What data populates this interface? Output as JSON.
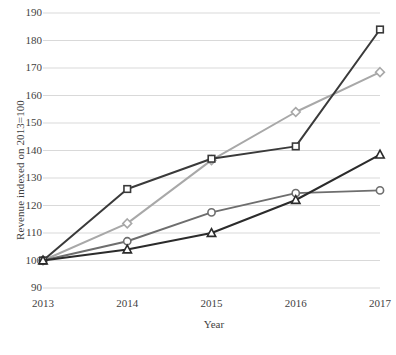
{
  "chart_data": {
    "type": "line",
    "title": "",
    "xlabel": "Year",
    "ylabel": "Revenue indexed on 2013=100",
    "categories": [
      "2013",
      "2014",
      "2015",
      "2016",
      "2017"
    ],
    "x_tick_labels": [
      "2013",
      "2014",
      "2015",
      "2016",
      "2017"
    ],
    "y_tick_labels": [
      "90",
      "100",
      "110",
      "120",
      "130",
      "140",
      "150",
      "160",
      "170",
      "180",
      "190"
    ],
    "y_ticks": [
      90,
      100,
      110,
      120,
      130,
      140,
      150,
      160,
      170,
      180,
      190
    ],
    "ylim": [
      90,
      190
    ],
    "grid": true,
    "grid_color": "#d9d9d9",
    "legend": "none",
    "background": "#ffffff",
    "series": [
      {
        "name": "series-square",
        "marker": "square",
        "color": "#3a3a3a",
        "values": [
          100,
          126,
          137,
          141.5,
          184
        ]
      },
      {
        "name": "series-diamond",
        "marker": "diamond",
        "color": "#a8a8a8",
        "values": [
          100,
          113.5,
          136.5,
          154,
          168.5
        ]
      },
      {
        "name": "series-circle",
        "marker": "circle",
        "color": "#6e6e6e",
        "values": [
          100,
          107,
          117.5,
          124.5,
          125.5
        ]
      },
      {
        "name": "series-triangle",
        "marker": "triangle",
        "color": "#2b2b2b",
        "values": [
          100,
          104,
          110,
          122,
          138.5
        ]
      }
    ]
  }
}
